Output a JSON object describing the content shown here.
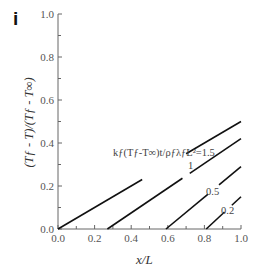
{
  "panel_label": "i",
  "chart_data": {
    "type": "line",
    "title": "",
    "xlabel": "x/L",
    "ylabel": "(T_f - T)/(T_f - T_∞)",
    "xlim": [
      0.0,
      1.0
    ],
    "ylim": [
      0.0,
      1.0
    ],
    "grid": false,
    "legend": "none (inline curve labels)",
    "x_ticks": [
      "0.0",
      "0.2",
      "0.4",
      "0.6",
      "0.8",
      "1.0"
    ],
    "y_ticks": [
      "0.0",
      "0.2",
      "0.4",
      "0.6",
      "0.8",
      "1.0"
    ],
    "annotation_parameter": "k_f(T_f - T_∞)t/ρ_f λ_f L² =",
    "series": [
      {
        "name": "1.5",
        "label": "k_f(T_f-T_∞)t/ρ_fλ_fL²=1.5",
        "x": [
          0.0,
          1.0
        ],
        "y": [
          0.0,
          0.5
        ]
      },
      {
        "name": "1",
        "label": "1",
        "x": [
          0.27,
          1.0
        ],
        "y": [
          0.0,
          0.42
        ]
      },
      {
        "name": "0.5",
        "label": "0.5",
        "x": [
          0.59,
          1.0
        ],
        "y": [
          0.0,
          0.29
        ]
      },
      {
        "name": "0.2",
        "label": "0.2",
        "x": [
          0.81,
          1.0
        ],
        "y": [
          0.0,
          0.15
        ]
      }
    ]
  },
  "labels": {
    "xlabel": "x/L",
    "ylabel": "(Tƒ - T)/(Tƒ - T∞)",
    "curve_main": "kƒ(Tƒ-T∞)t/ρƒλƒL²=1.5",
    "curve_1": "1",
    "curve_05": "0.5",
    "curve_02": "0.2"
  }
}
